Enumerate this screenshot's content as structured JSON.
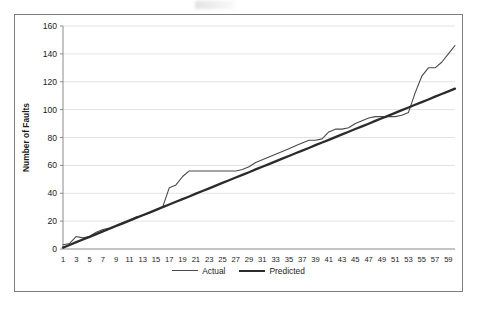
{
  "chart_data": {
    "type": "line",
    "title": "",
    "xlabel": "",
    "ylabel": "Number of Faults",
    "xlim": [
      1,
      60
    ],
    "ylim": [
      0,
      160
    ],
    "ytick_step": 20,
    "yticks": [
      0,
      20,
      40,
      60,
      80,
      100,
      120,
      140,
      160
    ],
    "xticks": [
      1,
      3,
      5,
      7,
      9,
      11,
      13,
      15,
      17,
      19,
      21,
      23,
      25,
      27,
      29,
      31,
      33,
      35,
      37,
      39,
      41,
      43,
      45,
      47,
      49,
      51,
      53,
      55,
      57,
      59
    ],
    "grid": "horizontal",
    "legend_position": "bottom-center",
    "x": [
      1,
      2,
      3,
      4,
      5,
      6,
      7,
      8,
      9,
      10,
      11,
      12,
      13,
      14,
      15,
      16,
      17,
      18,
      19,
      20,
      21,
      22,
      23,
      24,
      25,
      26,
      27,
      28,
      29,
      30,
      31,
      32,
      33,
      34,
      35,
      36,
      37,
      38,
      39,
      40,
      41,
      42,
      43,
      44,
      45,
      46,
      47,
      48,
      49,
      50,
      51,
      52,
      53,
      54,
      55,
      56,
      57,
      58,
      59,
      60
    ],
    "series": [
      {
        "name": "Actual",
        "color": "#4a4a4a",
        "width": 1.1,
        "values": [
          3,
          4,
          9,
          8,
          9,
          12,
          14,
          15,
          17,
          19,
          21,
          23,
          24,
          26,
          28,
          30,
          44,
          46,
          52,
          56,
          56,
          56,
          56,
          56,
          56,
          56,
          56,
          57,
          59,
          62,
          64,
          66,
          68,
          70,
          72,
          74,
          76,
          78,
          78,
          79,
          84,
          86,
          86,
          87,
          90,
          92,
          94,
          95,
          95,
          95,
          95,
          96,
          98,
          112,
          124,
          130,
          130,
          134,
          140,
          146
        ]
      },
      {
        "name": "Predicted",
        "color": "#2b2b2b",
        "width": 2.3,
        "values": [
          1.0,
          2.9,
          4.9,
          6.8,
          8.7,
          10.7,
          12.6,
          14.5,
          16.5,
          18.4,
          20.3,
          22.3,
          24.2,
          26.1,
          28.1,
          30.0,
          31.9,
          33.9,
          35.8,
          37.7,
          39.7,
          41.6,
          43.5,
          45.5,
          47.4,
          49.3,
          51.3,
          53.2,
          55.1,
          57.1,
          59.0,
          60.9,
          62.9,
          64.8,
          66.7,
          68.7,
          70.6,
          72.5,
          74.5,
          76.4,
          78.3,
          80.3,
          82.2,
          84.1,
          86.1,
          88.0,
          89.9,
          91.9,
          93.8,
          95.7,
          97.7,
          99.6,
          101.5,
          103.5,
          105.4,
          107.3,
          109.3,
          111.2,
          113.1,
          115.1
        ]
      }
    ]
  },
  "legend": {
    "actual_label": "Actual",
    "predicted_label": "Predicted"
  },
  "axis": {
    "y_title": "Number of Faults"
  },
  "colors": {
    "actual": "#4a4a4a",
    "predicted": "#2b2b2b",
    "grid": "#e2e2e2",
    "axis": "#8a8a8a",
    "frame": "#7d7d7d"
  }
}
